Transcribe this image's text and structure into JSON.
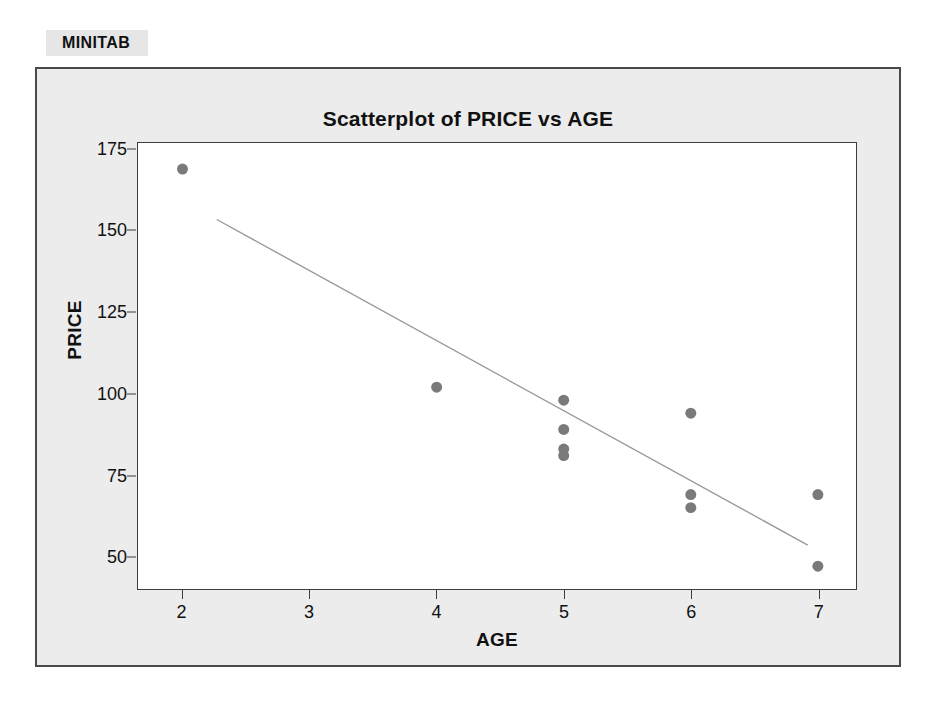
{
  "page": {
    "margin_artifact": "",
    "panel_label": "MINITAB"
  },
  "chart_data": {
    "type": "scatter",
    "title": "Scatterplot of PRICE vs AGE",
    "xlabel": "AGE",
    "ylabel": "PRICE",
    "xlim": [
      1.65,
      7.3
    ],
    "ylim": [
      40,
      177
    ],
    "grid": false,
    "legend": null,
    "xticks": [
      2,
      3,
      4,
      5,
      6,
      7
    ],
    "xtick_labels": [
      "2",
      "3",
      "4",
      "5",
      "6",
      "7"
    ],
    "yticks": [
      50,
      75,
      100,
      125,
      150,
      175
    ],
    "ytick_labels": [
      "50",
      "75",
      "100",
      "125",
      "150",
      "175"
    ],
    "marker": {
      "shape": "circle",
      "color": "#7a7a7a",
      "size": 11
    },
    "points": [
      {
        "x": 2,
        "y": 169
      },
      {
        "x": 4,
        "y": 102
      },
      {
        "x": 5,
        "y": 98
      },
      {
        "x": 5,
        "y": 89
      },
      {
        "x": 5,
        "y": 83
      },
      {
        "x": 5,
        "y": 81
      },
      {
        "x": 6,
        "y": 94
      },
      {
        "x": 6,
        "y": 69
      },
      {
        "x": 6,
        "y": 65
      },
      {
        "x": 7,
        "y": 69
      },
      {
        "x": 7,
        "y": 47
      }
    ],
    "fit_line": {
      "name": "regression-line",
      "color": "#9a9a9a",
      "x1": 2.27,
      "y1": 153.5,
      "x2": 6.92,
      "y2": 53.5
    }
  }
}
